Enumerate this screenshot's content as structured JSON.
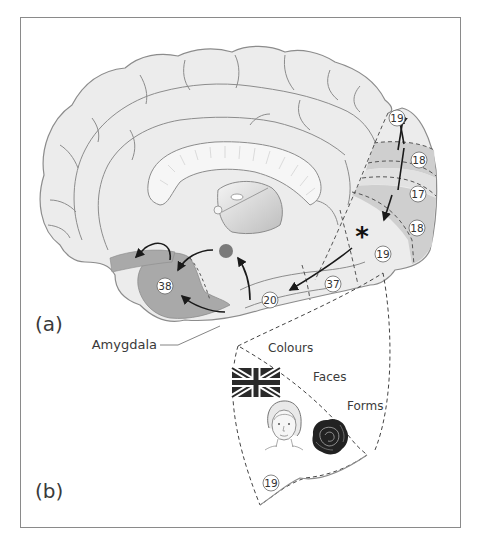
{
  "figure": {
    "panel_a_label": "(a)",
    "panel_b_label": "(b)",
    "amygdala_label": "Amygdala",
    "areas": {
      "a19_top": "19",
      "a18_upper": "18",
      "a17": "17",
      "a18_lower": "18",
      "a19_lower": "19",
      "a37": "37",
      "a20": "20",
      "a38": "38",
      "b19": "19"
    },
    "inset_labels": {
      "colours": "Colours",
      "faces": "Faces",
      "forms": "Forms"
    },
    "marker": "*",
    "inset_icons": [
      "union-flag-icon",
      "face-portrait-icon",
      "rose-icon"
    ],
    "colors": {
      "brain_fill": "#ececec",
      "outline": "#8c8c8c",
      "visual_band": "#cfcfcf",
      "temporal_pole": "#a9a9a9",
      "amygdala_dot": "#7a7a7a",
      "arrows": "#1a1a1a"
    }
  }
}
